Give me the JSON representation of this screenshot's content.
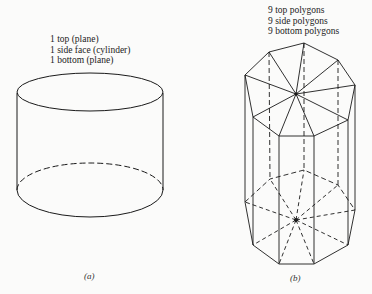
{
  "figure_a": {
    "labels": [
      "1 top (plane)",
      "1 side face (cylinder)",
      "1 bottom (plane)"
    ],
    "caption": "(a)",
    "shape": "cylinder"
  },
  "figure_b": {
    "labels": [
      "9 top polygons",
      "9 side polygons",
      "9 bottom polygons"
    ],
    "caption": "(b)",
    "shape": "nonagonal prism approximation of cylinder"
  },
  "colors": {
    "line": "#1a1a1a",
    "background": "#fbfbfa"
  }
}
